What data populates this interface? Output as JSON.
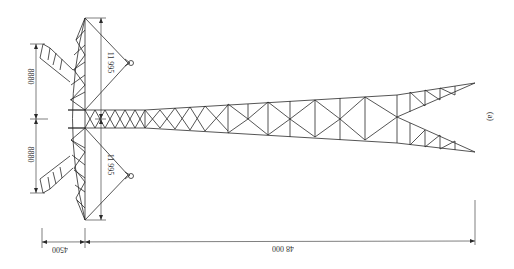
{
  "figure": {
    "subfigure_label": "(a)",
    "dimensions": {
      "crossarm_upper_half": "8880",
      "crossarm_lower_half": "8880",
      "ground_wire_upper": "11 995",
      "ground_wire_lower": "11 995",
      "crossarm_depth": "4500",
      "tower_height": "48 000"
    }
  },
  "colors": {
    "line": "#2a2a2a",
    "background": "#ffffff"
  }
}
